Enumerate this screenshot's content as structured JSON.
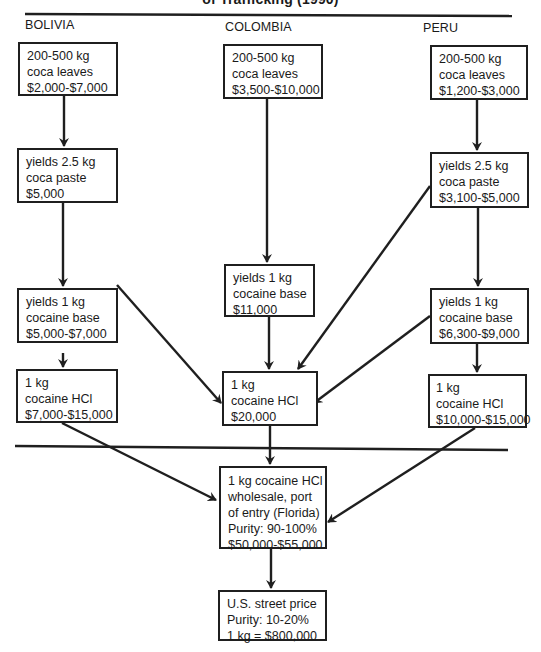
{
  "title": "of Trafficking (1990)",
  "colors": {
    "ink": "#1f1f1f",
    "background": "#ffffff"
  },
  "columns": [
    {
      "country": "BOLIVIA",
      "boxes": [
        {
          "lines": [
            "200-500 kg",
            "coca leaves",
            "$2,000-$7,000"
          ]
        },
        {
          "lines": [
            "yields 2.5 kg",
            "coca paste",
            "$5,000"
          ]
        },
        {
          "lines": [
            "yields 1 kg",
            "cocaine base",
            "$5,000-$7,000"
          ]
        },
        {
          "lines": [
            "1 kg",
            "cocaine HCl",
            "$7,000-$15,000"
          ]
        }
      ]
    },
    {
      "country": "COLOMBIA",
      "boxes": [
        {
          "lines": [
            "200-500 kg",
            "coca leaves",
            "$3,500-$10,000"
          ]
        },
        {
          "lines": [
            "yields 1 kg",
            "cocaine base",
            "$11,000"
          ]
        },
        {
          "lines": [
            "1 kg",
            "cocaine HCl",
            "$20,000"
          ]
        }
      ]
    },
    {
      "country": "PERU",
      "boxes": [
        {
          "lines": [
            "200-500 kg",
            "coca leaves",
            "$1,200-$3,000"
          ]
        },
        {
          "lines": [
            "yields 2.5 kg",
            "coca paste",
            "$3,100-$5,000"
          ]
        },
        {
          "lines": [
            "yields 1 kg",
            "cocaine base",
            "$6,300-$9,000"
          ]
        },
        {
          "lines": [
            "1 kg",
            "cocaine HCl",
            "$10,000-$15,000"
          ]
        }
      ]
    }
  ],
  "wholesale": {
    "lines": [
      "1 kg cocaine HCl",
      "wholesale, port",
      "of entry (Florida)",
      "Purity: 90-100%",
      "$50,000-$55,000"
    ]
  },
  "street": {
    "lines": [
      "U.S. street price",
      "Purity: 10-20%",
      "1 kg = $800,000"
    ]
  }
}
